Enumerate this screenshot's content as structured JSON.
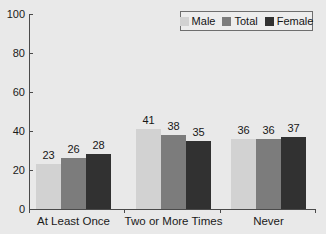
{
  "chart_data": {
    "type": "bar",
    "title": "",
    "subtitle": "",
    "xlabel": "",
    "ylabel": "",
    "ylim": [
      0,
      100
    ],
    "yticks": [
      0,
      20,
      40,
      60,
      80,
      100
    ],
    "ytick_labels": [
      "0",
      "20",
      "40",
      "60",
      "80",
      "100"
    ],
    "grid": false,
    "legend_position": "top-right",
    "categories": [
      "At Least Once",
      "Two or More Times",
      "Never"
    ],
    "series": [
      {
        "name": "Male",
        "color": "#d2d2d2",
        "values": [
          23,
          41,
          36
        ]
      },
      {
        "name": "Total",
        "color": "#7c7c7c",
        "values": [
          26,
          38,
          36
        ]
      },
      {
        "name": "Female",
        "color": "#313131",
        "values": [
          28,
          35,
          37
        ]
      }
    ],
    "data_labels": [
      [
        "23",
        "26",
        "28"
      ],
      [
        "41",
        "38",
        "35"
      ],
      [
        "36",
        "36",
        "37"
      ]
    ]
  },
  "legend": {
    "entries": [
      {
        "label": "Male",
        "swatch": "legend-swatch-male"
      },
      {
        "label": "Total",
        "swatch": "legend-swatch-total"
      },
      {
        "label": "Female",
        "swatch": "legend-swatch-female"
      }
    ]
  },
  "colors": {
    "background": "#e9e9e9",
    "axis": "#4a4a4a",
    "text": "#1a1a1a",
    "male": "#d2d2d2",
    "total": "#7c7c7c",
    "female": "#313131",
    "legend_background": "#ededed",
    "legend_border": "#6e6e6e"
  }
}
